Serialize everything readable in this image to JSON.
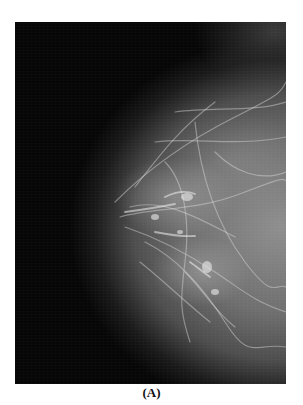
{
  "figure": {
    "type": "mammogram",
    "view": "breast tissue X-ray, nipple facing left",
    "caption": "(A)",
    "colors": {
      "background": "#ffffff",
      "image_background": "#060606",
      "tissue": "#8c8c8c",
      "caption_text": "#111111"
    }
  }
}
